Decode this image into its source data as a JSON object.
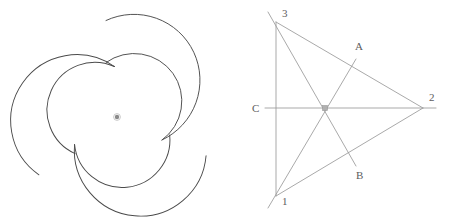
{
  "page": {
    "width": 451,
    "height": 220,
    "background": "#ffffff",
    "figure_count": 2
  },
  "colors": {
    "outline": "#4a4a4a",
    "construction_line": "#9a9a9a",
    "label_text": "#5d5d5d",
    "center_dot": "#7a7a7a",
    "background": "#ffffff"
  },
  "figures": [
    {
      "id": "pinwheel",
      "name": "triskelion-pinwheel",
      "caption": "",
      "description": "Three-fold rotationally symmetric pinwheel outline built from circular arcs, with a small dot marking the center of rotation.",
      "symmetry_order": 3,
      "center": {
        "x": 117,
        "y": 117
      },
      "bounds": {
        "x_min": 22,
        "x_max": 201,
        "y_min": 17,
        "y_max": 208
      },
      "center_dot": {
        "label": "center-of-rotation",
        "radius": 2.2
      },
      "stroke_width": 0.9
    },
    {
      "id": "triangle",
      "name": "triangle-cevians",
      "caption": "",
      "description": "Triangle with vertices labelled 1, 2 and 3 and three concurrent cevians meeting at the centroid; rays extend past the triangle to points A, B and C.",
      "vertices": [
        {
          "label": "1",
          "x": 276,
          "y": 196,
          "label_x": 282,
          "label_y": 205
        },
        {
          "label": "2",
          "x": 423,
          "y": 108,
          "label_x": 429,
          "label_y": 101
        },
        {
          "label": "3",
          "x": 276,
          "y": 22,
          "label_x": 282,
          "label_y": 17
        }
      ],
      "centroid": {
        "x": 325,
        "y": 108
      },
      "ray_points": [
        {
          "label": "A",
          "x": 354,
          "y": 62,
          "label_x": 359,
          "label_y": 50
        },
        {
          "label": "B",
          "x": 353,
          "y": 163,
          "label_x": 359,
          "label_y": 178
        },
        {
          "label": "C",
          "x": 266,
          "y": 108,
          "label_x": 257,
          "label_y": 111
        }
      ],
      "edges": [
        {
          "name": "side-3-1",
          "from": "3",
          "to": "1"
        },
        {
          "name": "side-3-2",
          "from": "3",
          "to": "2"
        },
        {
          "name": "side-1-2",
          "from": "1",
          "to": "2"
        }
      ],
      "cevians": [
        {
          "name": "cevian-1-to-A",
          "from": "1",
          "through": "centroid",
          "to": "A"
        },
        {
          "name": "cevian-3-to-B",
          "from": "3",
          "through": "centroid",
          "to": "B"
        },
        {
          "name": "cevian-C-to-2",
          "from": "C",
          "through": "centroid",
          "to": "2"
        }
      ],
      "stroke_width": 0.8
    }
  ]
}
